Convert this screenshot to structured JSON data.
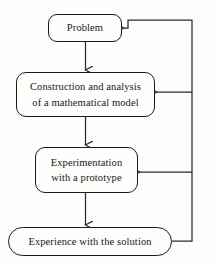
{
  "diagram": {
    "type": "flowchart",
    "background_color": "#fdfdfc",
    "line_color": "#2b2b2b",
    "text_color": "#17171a",
    "nodes": [
      {
        "id": "problem",
        "shape": "rounded-rectangle",
        "lines": [
          "Problem"
        ]
      },
      {
        "id": "model",
        "shape": "rounded-rectangle",
        "lines": [
          "Construction and analysis",
          "of a mathematical model"
        ]
      },
      {
        "id": "experiment",
        "shape": "rounded-rectangle",
        "lines": [
          "Experimentation",
          "with a prototype"
        ]
      },
      {
        "id": "experience",
        "shape": "stadium",
        "lines": [
          "Experience with the solution"
        ]
      }
    ],
    "edges": [
      {
        "id": "problem-to-model",
        "from": "problem",
        "to": "model",
        "direction": "down",
        "arrow": true
      },
      {
        "id": "model-to-experiment",
        "from": "model",
        "to": "experiment",
        "direction": "down",
        "arrow": true
      },
      {
        "id": "experiment-to-experience",
        "from": "experiment",
        "to": "experience",
        "direction": "down",
        "arrow": true
      },
      {
        "id": "experience-to-problem",
        "from": "experience",
        "to": "problem",
        "direction": "feedback-up",
        "arrow": true
      },
      {
        "id": "experience-to-model",
        "from": "experience",
        "to": "model",
        "direction": "feedback-left",
        "arrow": true
      },
      {
        "id": "experience-to-experiment",
        "from": "experience",
        "to": "experiment",
        "direction": "feedback-left",
        "arrow": true
      }
    ]
  }
}
